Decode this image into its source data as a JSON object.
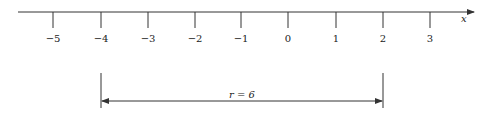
{
  "axis": {
    "variable": "x",
    "ticks": [
      {
        "value": -5,
        "label": "−5",
        "px": 53
      },
      {
        "value": -4,
        "label": "−4",
        "px": 101
      },
      {
        "value": -3,
        "label": "−3",
        "px": 148
      },
      {
        "value": -2,
        "label": "−2",
        "px": 195
      },
      {
        "value": -1,
        "label": "−1",
        "px": 241
      },
      {
        "value": 0,
        "label": "0",
        "px": 288
      },
      {
        "value": 1,
        "label": "1",
        "px": 336
      },
      {
        "value": 2,
        "label": "2",
        "px": 383
      },
      {
        "value": 3,
        "label": "3",
        "px": 430
      }
    ]
  },
  "range_bracket": {
    "from": -4,
    "to": 2,
    "label": "r = 6"
  },
  "colors": {
    "line": "#333333"
  }
}
